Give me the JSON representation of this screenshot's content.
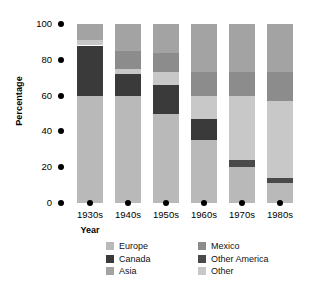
{
  "chart_data": {
    "type": "bar",
    "subtype": "stacked-percentage",
    "title": "",
    "xlabel": "Year",
    "ylabel": "Percentage",
    "ylim": [
      0,
      100
    ],
    "yticks": [
      0,
      20,
      40,
      60,
      80,
      100
    ],
    "grid": false,
    "legend_position": "bottom",
    "categories": [
      "1930s",
      "1940s",
      "1950s",
      "1960s",
      "1970s",
      "1980s"
    ],
    "series": [
      {
        "name": "Europe",
        "color": "#b9b9b9",
        "values": [
          60,
          60,
          50,
          35,
          20,
          11
        ]
      },
      {
        "name": "Canada",
        "color": "#3a3a3a",
        "values": [
          28,
          12,
          16,
          12,
          0,
          0
        ]
      },
      {
        "name": "Asia",
        "color": "#a3a3a3",
        "values": [
          9,
          15,
          16,
          27,
          27,
          27
        ]
      },
      {
        "name": "Mexico",
        "color": "#8c8c8c",
        "values": [
          0,
          10,
          11,
          13,
          13,
          16
        ]
      },
      {
        "name": "Other America",
        "color": "#4a4a4a",
        "values": [
          0,
          0,
          0,
          0,
          4,
          3
        ]
      },
      {
        "name": "Other",
        "color": "#c8c8c8",
        "values": [
          3,
          3,
          7,
          13,
          36,
          43
        ]
      }
    ],
    "stack_order": [
      "Europe",
      "Other America",
      "Canada",
      "Other",
      "Mexico",
      "Asia"
    ],
    "bar_stacks": [
      {
        "category": "1930s",
        "segments": [
          {
            "name": "Europe",
            "from": 0,
            "to": 60
          },
          {
            "name": "Canada",
            "from": 60,
            "to": 88
          },
          {
            "name": "Other",
            "from": 88,
            "to": 91
          },
          {
            "name": "Asia",
            "from": 91,
            "to": 100
          }
        ]
      },
      {
        "category": "1940s",
        "segments": [
          {
            "name": "Europe",
            "from": 0,
            "to": 60
          },
          {
            "name": "Canada",
            "from": 60,
            "to": 72
          },
          {
            "name": "Other",
            "from": 72,
            "to": 75
          },
          {
            "name": "Mexico",
            "from": 75,
            "to": 85
          },
          {
            "name": "Asia",
            "from": 85,
            "to": 100
          }
        ]
      },
      {
        "category": "1950s",
        "segments": [
          {
            "name": "Europe",
            "from": 0,
            "to": 50
          },
          {
            "name": "Canada",
            "from": 50,
            "to": 66
          },
          {
            "name": "Other",
            "from": 66,
            "to": 73
          },
          {
            "name": "Mexico",
            "from": 73,
            "to": 84
          },
          {
            "name": "Asia",
            "from": 84,
            "to": 100
          }
        ]
      },
      {
        "category": "1960s",
        "segments": [
          {
            "name": "Europe",
            "from": 0,
            "to": 35
          },
          {
            "name": "Canada",
            "from": 35,
            "to": 47
          },
          {
            "name": "Other",
            "from": 47,
            "to": 60
          },
          {
            "name": "Mexico",
            "from": 60,
            "to": 73
          },
          {
            "name": "Asia",
            "from": 73,
            "to": 100
          }
        ]
      },
      {
        "category": "1970s",
        "segments": [
          {
            "name": "Europe",
            "from": 0,
            "to": 20
          },
          {
            "name": "Other America",
            "from": 20,
            "to": 24
          },
          {
            "name": "Other",
            "from": 24,
            "to": 60
          },
          {
            "name": "Mexico",
            "from": 60,
            "to": 73
          },
          {
            "name": "Asia",
            "from": 73,
            "to": 100
          }
        ]
      },
      {
        "category": "1980s",
        "segments": [
          {
            "name": "Europe",
            "from": 0,
            "to": 11
          },
          {
            "name": "Other America",
            "from": 11,
            "to": 14
          },
          {
            "name": "Other",
            "from": 14,
            "to": 57
          },
          {
            "name": "Mexico",
            "from": 57,
            "to": 73
          },
          {
            "name": "Asia",
            "from": 73,
            "to": 100
          }
        ]
      }
    ]
  },
  "axes": {
    "y_title": "Percentage",
    "x_title": "Year",
    "y_ticks": [
      "100",
      "80",
      "60",
      "40",
      "20",
      "0"
    ],
    "x_ticks": [
      "1930s",
      "1940s",
      "1950s",
      "1960s",
      "1970s",
      "1980s"
    ]
  },
  "legend": {
    "column1": [
      {
        "label": "Europe",
        "color": "#b9b9b9"
      },
      {
        "label": "Canada",
        "color": "#3a3a3a"
      },
      {
        "label": "Asia",
        "color": "#a3a3a3"
      }
    ],
    "column2": [
      {
        "label": "Mexico",
        "color": "#8c8c8c"
      },
      {
        "label": "Other America",
        "color": "#4a4a4a"
      },
      {
        "label": "Other",
        "color": "#c8c8c8"
      }
    ]
  }
}
